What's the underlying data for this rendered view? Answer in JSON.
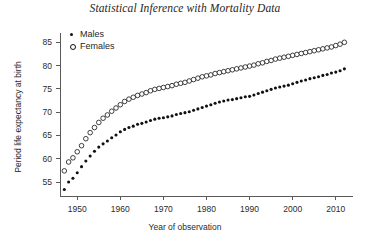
{
  "chart_data": {
    "type": "scatter",
    "title": "Statistical Inference with Mortality Data",
    "xlabel": "Year of observation",
    "ylabel": "Period life expectancy at birth",
    "xlim": [
      1946,
      2014
    ],
    "ylim": [
      52,
      87
    ],
    "xticks": [
      1950,
      1960,
      1970,
      1980,
      1990,
      2000,
      2010
    ],
    "yticks": [
      55,
      60,
      65,
      70,
      75,
      80,
      85
    ],
    "grid": false,
    "legend_position": "top-left",
    "legend": [
      "Males",
      "Females"
    ],
    "marker_color": "#111111",
    "series": [
      {
        "name": "Males",
        "marker": "filled-circle",
        "x": [
          1947,
          1948,
          1949,
          1950,
          1951,
          1952,
          1953,
          1954,
          1955,
          1956,
          1957,
          1958,
          1959,
          1960,
          1961,
          1962,
          1963,
          1964,
          1965,
          1966,
          1967,
          1968,
          1969,
          1970,
          1971,
          1972,
          1973,
          1974,
          1975,
          1976,
          1977,
          1978,
          1979,
          1980,
          1981,
          1982,
          1983,
          1984,
          1985,
          1986,
          1987,
          1988,
          1989,
          1990,
          1991,
          1992,
          1993,
          1994,
          1995,
          1996,
          1997,
          1998,
          1999,
          2000,
          2001,
          2002,
          2003,
          2004,
          2005,
          2006,
          2007,
          2008,
          2009,
          2010,
          2011,
          2012
        ],
        "values": [
          53.4,
          55.0,
          55.8,
          57.0,
          58.3,
          59.5,
          60.6,
          61.6,
          62.5,
          63.2,
          63.8,
          64.5,
          65.1,
          65.8,
          66.3,
          66.7,
          67.0,
          67.4,
          67.6,
          67.9,
          68.2,
          68.5,
          68.7,
          68.8,
          69.0,
          69.2,
          69.5,
          69.7,
          69.9,
          70.1,
          70.4,
          70.7,
          71.0,
          71.3,
          71.6,
          71.9,
          72.2,
          72.4,
          72.6,
          72.7,
          72.9,
          73.1,
          73.3,
          73.4,
          73.7,
          74.0,
          74.3,
          74.6,
          74.9,
          75.2,
          75.4,
          75.6,
          75.8,
          76.1,
          76.4,
          76.7,
          76.9,
          77.2,
          77.4,
          77.6,
          77.9,
          78.1,
          78.4,
          78.6,
          78.9,
          79.3
        ]
      },
      {
        "name": "Females",
        "marker": "open-circle",
        "x": [
          1947,
          1948,
          1949,
          1950,
          1951,
          1952,
          1953,
          1954,
          1955,
          1956,
          1957,
          1958,
          1959,
          1960,
          1961,
          1962,
          1963,
          1964,
          1965,
          1966,
          1967,
          1968,
          1969,
          1970,
          1971,
          1972,
          1973,
          1974,
          1975,
          1976,
          1977,
          1978,
          1979,
          1980,
          1981,
          1982,
          1983,
          1984,
          1985,
          1986,
          1987,
          1988,
          1989,
          1990,
          1991,
          1992,
          1993,
          1994,
          1995,
          1996,
          1997,
          1998,
          1999,
          2000,
          2001,
          2002,
          2003,
          2004,
          2005,
          2006,
          2007,
          2008,
          2009,
          2010,
          2011,
          2012
        ],
        "values": [
          57.4,
          59.3,
          60.2,
          61.5,
          62.8,
          64.3,
          65.6,
          66.7,
          67.8,
          68.7,
          69.4,
          70.2,
          70.9,
          71.6,
          72.3,
          72.8,
          73.2,
          73.6,
          73.9,
          74.2,
          74.6,
          74.9,
          75.1,
          75.3,
          75.5,
          75.7,
          76.0,
          76.2,
          76.4,
          76.7,
          77.0,
          77.3,
          77.6,
          77.8,
          78.0,
          78.3,
          78.5,
          78.7,
          78.9,
          79.1,
          79.3,
          79.5,
          79.7,
          79.9,
          80.1,
          80.4,
          80.6,
          80.9,
          81.1,
          81.4,
          81.6,
          81.8,
          82.0,
          82.2,
          82.4,
          82.6,
          82.8,
          83.0,
          83.2,
          83.4,
          83.6,
          83.8,
          84.0,
          84.3,
          84.6,
          85.0
        ]
      }
    ]
  }
}
